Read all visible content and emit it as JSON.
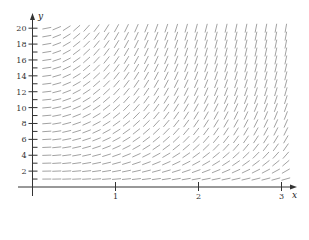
{
  "chart_data": {
    "type": "slope_field",
    "title": "",
    "xlabel": "x",
    "ylabel": "y",
    "xlim": [
      0,
      3.1
    ],
    "ylim": [
      0,
      21
    ],
    "x_ticks": [
      1,
      2,
      3
    ],
    "y_ticks": [
      2,
      4,
      6,
      8,
      10,
      12,
      14,
      16,
      18,
      20
    ],
    "grid": false,
    "differential_equation_estimate": "dy/dx = x*y",
    "field_grid": {
      "x_start": 0.1,
      "x_step": 0.12,
      "x_count": 25,
      "y_start": 1,
      "y_step": 1,
      "y_count": 20
    },
    "segment_length_px": 9
  },
  "colors": {
    "axis": "#333333",
    "segment": "#8a8a8a",
    "background": "#ffffff"
  }
}
